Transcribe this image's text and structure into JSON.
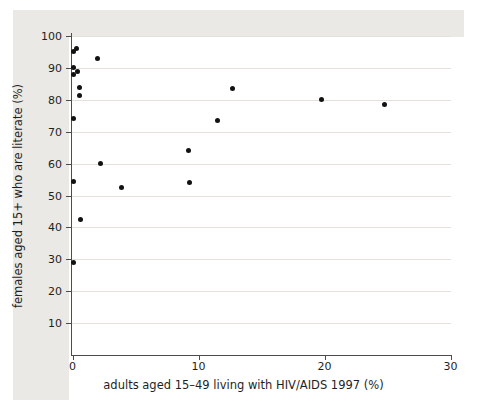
{
  "chart_data": {
    "type": "scatter",
    "title": "",
    "xlabel": "adults aged 15–49 living with HIV/AIDS 1997 (%)",
    "ylabel": "females aged 15+ who are literate (%)",
    "xlim": [
      0,
      30
    ],
    "ylim": [
      0,
      100
    ],
    "x_ticks": [
      0,
      10,
      20,
      30
    ],
    "y_ticks": [
      10,
      20,
      30,
      40,
      50,
      60,
      70,
      80,
      90,
      100
    ],
    "grid": "horizontal-only",
    "legend": "none",
    "marker": {
      "shape": "circle",
      "color": "#121212",
      "diameter_px": 5
    },
    "points": [
      [
        0.1,
        95
      ],
      [
        0.3,
        96
      ],
      [
        2.0,
        93
      ],
      [
        0.1,
        90
      ],
      [
        0.4,
        89
      ],
      [
        0.1,
        88
      ],
      [
        0.55,
        84
      ],
      [
        0.55,
        81.5
      ],
      [
        0.1,
        74
      ],
      [
        0.1,
        54.5
      ],
      [
        2.2,
        60
      ],
      [
        3.9,
        52.5
      ],
      [
        9.2,
        64
      ],
      [
        9.3,
        54
      ],
      [
        11.5,
        73.5
      ],
      [
        12.7,
        83.5
      ],
      [
        19.8,
        80
      ],
      [
        24.8,
        78.5
      ],
      [
        0.6,
        42.5
      ],
      [
        0.1,
        29
      ]
    ]
  },
  "colors": {
    "page_background": "#ffffff",
    "panel_background": "#eae9e5",
    "plot_background": "#ffffff",
    "gridline": "#e4e1da",
    "axis": "#4d4d4d",
    "text": "#1f1f1f",
    "marker": "#121212"
  }
}
